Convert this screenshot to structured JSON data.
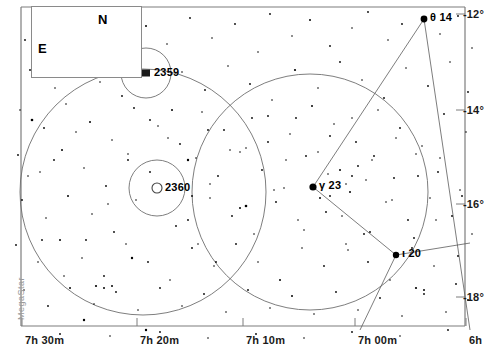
{
  "chart_data": {
    "type": "scatter",
    "xlabel": "Right Ascension",
    "ylabel": "Declination",
    "grid": false,
    "legend": "none",
    "xlim": [
      "7h 35m",
      "6h 55m"
    ],
    "ylim": [
      -19.0,
      -11.5
    ],
    "x_ticks": [
      {
        "label": "7h 30m",
        "px": 22
      },
      {
        "label": "7h 20m",
        "px": 137
      },
      {
        "label": "7h 10m",
        "px": 243
      },
      {
        "label": "7h 00m",
        "px": 355
      },
      {
        "label": "6h",
        "px": 466
      }
    ],
    "y_ticks": [
      {
        "label": "-12°",
        "px": 14
      },
      {
        "label": "-14°",
        "px": 110
      },
      {
        "label": "-16°",
        "px": 204
      },
      {
        "label": "-18°",
        "px": 297
      }
    ],
    "named_stars": [
      {
        "name": "θ 14",
        "x": 424,
        "y": 19,
        "mag_px": 3.4
      },
      {
        "name": "γ 23",
        "x": 313,
        "y": 187,
        "mag_px": 3.6
      },
      {
        "name": "ι 20",
        "x": 396,
        "y": 255,
        "mag_px": 3.2
      }
    ],
    "deep_sky_objects": [
      {
        "name": "2359",
        "type": "nebula",
        "x": 146,
        "y": 73,
        "circle_r": 25
      },
      {
        "name": "2360",
        "type": "open-cluster",
        "x": 157,
        "y": 188,
        "circle_r": 28
      }
    ],
    "fov_circles": [
      {
        "cx": 143,
        "cy": 192,
        "r": 123
      },
      {
        "cx": 310,
        "cy": 192,
        "r": 118
      }
    ],
    "constellation_lines": [
      {
        "x1": 424,
        "y1": 19,
        "x2": 313,
        "y2": 187
      },
      {
        "x1": 313,
        "y1": 187,
        "x2": 396,
        "y2": 255
      },
      {
        "x1": 396,
        "y1": 255,
        "x2": 470,
        "y2": 243
      },
      {
        "x1": 396,
        "y1": 255,
        "x2": 360,
        "y2": 330
      },
      {
        "x1": 424,
        "y1": 19,
        "x2": 470,
        "y2": 330
      }
    ],
    "stars": [
      [
        25,
        40,
        0.9
      ],
      [
        48,
        22,
        0.8
      ],
      [
        70,
        55,
        0.9
      ],
      [
        95,
        33,
        0.8
      ],
      [
        118,
        48,
        0.9
      ],
      [
        146,
        26,
        1.0
      ],
      [
        167,
        44,
        0.8
      ],
      [
        190,
        18,
        0.9
      ],
      [
        212,
        38,
        0.8
      ],
      [
        235,
        24,
        0.9
      ],
      [
        258,
        52,
        0.8
      ],
      [
        270,
        14,
        0.9
      ],
      [
        292,
        36,
        0.8
      ],
      [
        310,
        20,
        1.0
      ],
      [
        330,
        46,
        0.9
      ],
      [
        352,
        28,
        0.8
      ],
      [
        368,
        12,
        0.9
      ],
      [
        388,
        40,
        0.8
      ],
      [
        402,
        24,
        0.9
      ],
      [
        440,
        34,
        0.8
      ],
      [
        458,
        16,
        0.9
      ],
      [
        472,
        48,
        0.8
      ],
      [
        30,
        70,
        0.9
      ],
      [
        55,
        88,
        0.8
      ],
      [
        78,
        64,
        1.0
      ],
      [
        100,
        82,
        0.8
      ],
      [
        122,
        96,
        0.9
      ],
      [
        182,
        72,
        0.8
      ],
      [
        205,
        90,
        0.9
      ],
      [
        228,
        66,
        0.8
      ],
      [
        250,
        84,
        0.9
      ],
      [
        272,
        100,
        0.8
      ],
      [
        295,
        70,
        1.1
      ],
      [
        318,
        88,
        0.8
      ],
      [
        340,
        62,
        0.9
      ],
      [
        362,
        80,
        0.8
      ],
      [
        384,
        98,
        0.9
      ],
      [
        406,
        68,
        0.8
      ],
      [
        428,
        86,
        0.9
      ],
      [
        450,
        62,
        0.8
      ],
      [
        468,
        92,
        0.9
      ],
      [
        20,
        110,
        0.8
      ],
      [
        44,
        128,
        0.9
      ],
      [
        66,
        104,
        0.8
      ],
      [
        90,
        122,
        1.0
      ],
      [
        112,
        140,
        0.8
      ],
      [
        134,
        108,
        0.9
      ],
      [
        158,
        126,
        0.8
      ],
      [
        180,
        144,
        0.9
      ],
      [
        202,
        112,
        0.8
      ],
      [
        224,
        130,
        0.9
      ],
      [
        246,
        148,
        0.8
      ],
      [
        268,
        116,
        0.9
      ],
      [
        290,
        134,
        0.8
      ],
      [
        312,
        106,
        1.0
      ],
      [
        334,
        124,
        0.8
      ],
      [
        356,
        142,
        0.9
      ],
      [
        378,
        110,
        0.8
      ],
      [
        400,
        128,
        0.9
      ],
      [
        422,
        146,
        0.8
      ],
      [
        444,
        114,
        0.9
      ],
      [
        466,
        132,
        0.8
      ],
      [
        18,
        155,
        0.9
      ],
      [
        40,
        172,
        0.8
      ],
      [
        62,
        150,
        1.0
      ],
      [
        84,
        168,
        0.8
      ],
      [
        106,
        186,
        0.9
      ],
      [
        128,
        154,
        0.8
      ],
      [
        150,
        172,
        0.9
      ],
      [
        196,
        158,
        0.8
      ],
      [
        218,
        176,
        0.9
      ],
      [
        240,
        152,
        0.8
      ],
      [
        262,
        170,
        0.9
      ],
      [
        284,
        188,
        0.8
      ],
      [
        306,
        156,
        0.9
      ],
      [
        328,
        174,
        0.8
      ],
      [
        350,
        192,
        1.0
      ],
      [
        372,
        160,
        0.8
      ],
      [
        394,
        178,
        0.9
      ],
      [
        416,
        154,
        0.8
      ],
      [
        438,
        172,
        0.9
      ],
      [
        460,
        190,
        0.8
      ],
      [
        22,
        200,
        0.9
      ],
      [
        46,
        218,
        0.8
      ],
      [
        68,
        196,
        1.0
      ],
      [
        92,
        214,
        0.8
      ],
      [
        114,
        232,
        0.9
      ],
      [
        136,
        200,
        0.8
      ],
      [
        188,
        220,
        0.9
      ],
      [
        210,
        198,
        0.8
      ],
      [
        232,
        216,
        0.9
      ],
      [
        254,
        234,
        0.8
      ],
      [
        276,
        202,
        0.9
      ],
      [
        298,
        220,
        0.8
      ],
      [
        320,
        198,
        1.0
      ],
      [
        342,
        216,
        0.8
      ],
      [
        364,
        234,
        0.9
      ],
      [
        386,
        202,
        0.8
      ],
      [
        408,
        220,
        0.9
      ],
      [
        430,
        198,
        0.8
      ],
      [
        452,
        216,
        0.9
      ],
      [
        472,
        234,
        0.8
      ],
      [
        16,
        245,
        0.9
      ],
      [
        38,
        262,
        0.8
      ],
      [
        60,
        240,
        1.0
      ],
      [
        82,
        258,
        0.8
      ],
      [
        104,
        276,
        0.9
      ],
      [
        126,
        244,
        0.8
      ],
      [
        148,
        262,
        0.9
      ],
      [
        170,
        280,
        0.8
      ],
      [
        192,
        248,
        0.9
      ],
      [
        214,
        266,
        0.8
      ],
      [
        236,
        244,
        0.9
      ],
      [
        258,
        262,
        0.8
      ],
      [
        280,
        280,
        1.0
      ],
      [
        302,
        248,
        0.8
      ],
      [
        324,
        266,
        0.9
      ],
      [
        346,
        244,
        0.8
      ],
      [
        368,
        262,
        0.9
      ],
      [
        390,
        280,
        0.8
      ],
      [
        412,
        248,
        0.9
      ],
      [
        434,
        266,
        0.8
      ],
      [
        456,
        284,
        0.9
      ],
      [
        24,
        290,
        0.8
      ],
      [
        48,
        306,
        0.9
      ],
      [
        70,
        288,
        1.0
      ],
      [
        94,
        304,
        0.8
      ],
      [
        116,
        292,
        0.9
      ],
      [
        138,
        310,
        0.8
      ],
      [
        160,
        288,
        0.9
      ],
      [
        182,
        306,
        0.8
      ],
      [
        204,
        294,
        0.9
      ],
      [
        226,
        312,
        0.8
      ],
      [
        248,
        290,
        0.9
      ],
      [
        270,
        308,
        0.8
      ],
      [
        292,
        296,
        1.0
      ],
      [
        314,
        314,
        0.8
      ],
      [
        336,
        292,
        0.9
      ],
      [
        358,
        310,
        0.8
      ],
      [
        380,
        298,
        0.9
      ],
      [
        402,
        316,
        0.8
      ],
      [
        424,
        294,
        0.9
      ],
      [
        446,
        312,
        0.8
      ],
      [
        468,
        300,
        0.9
      ],
      [
        32,
        120,
        1.3
      ],
      [
        84,
        320,
        1.2
      ],
      [
        246,
        206,
        1.3
      ],
      [
        240,
        208,
        1.0
      ],
      [
        188,
        160,
        1.2
      ],
      [
        132,
        258,
        1.2
      ],
      [
        96,
        286,
        1.1
      ],
      [
        104,
        288,
        1.0
      ],
      [
        112,
        286,
        1.0
      ],
      [
        416,
        288,
        1.1
      ],
      [
        424,
        290,
        1.0
      ],
      [
        146,
        330,
        1.2
      ],
      [
        60,
        334,
        0.9
      ],
      [
        110,
        336,
        0.8
      ],
      [
        160,
        332,
        0.9
      ],
      [
        208,
        338,
        0.8
      ],
      [
        256,
        334,
        0.9
      ],
      [
        304,
        338,
        0.8
      ],
      [
        352,
        332,
        0.9
      ],
      [
        400,
        336,
        0.8
      ],
      [
        448,
        330,
        0.9
      ],
      [
        172,
        110,
        1.0
      ],
      [
        150,
        120,
        0.9
      ],
      [
        168,
        138,
        0.8
      ],
      [
        192,
        196,
        0.9
      ],
      [
        210,
        184,
        0.8
      ],
      [
        176,
        226,
        0.9
      ],
      [
        198,
        244,
        0.8
      ],
      [
        216,
        262,
        0.9
      ],
      [
        128,
        160,
        0.9
      ],
      [
        108,
        204,
        0.8
      ],
      [
        86,
        240,
        0.9
      ],
      [
        64,
        276,
        0.8
      ],
      [
        42,
        240,
        0.9
      ],
      [
        28,
        176,
        0.8
      ],
      [
        54,
        160,
        0.9
      ],
      [
        76,
        132,
        0.8
      ],
      [
        330,
        136,
        0.9
      ],
      [
        352,
        118,
        0.8
      ],
      [
        374,
        156,
        0.9
      ],
      [
        396,
        138,
        0.8
      ],
      [
        418,
        176,
        0.9
      ],
      [
        440,
        158,
        0.8
      ],
      [
        462,
        196,
        0.9
      ],
      [
        286,
        160,
        0.8
      ],
      [
        268,
        142,
        0.9
      ],
      [
        304,
        230,
        0.8
      ],
      [
        326,
        212,
        0.9
      ],
      [
        348,
        250,
        0.8
      ],
      [
        370,
        232,
        0.9
      ],
      [
        392,
        200,
        0.8
      ],
      [
        414,
        238,
        0.9
      ],
      [
        436,
        220,
        0.8
      ],
      [
        458,
        256,
        0.9
      ],
      [
        340,
        170,
        1.0
      ],
      [
        352,
        176,
        0.9
      ],
      [
        346,
        184,
        0.8
      ],
      [
        358,
        166,
        0.9
      ],
      [
        366,
        180,
        0.8
      ],
      [
        330,
        196,
        0.9
      ],
      [
        318,
        152,
        0.8
      ],
      [
        296,
        118,
        0.9
      ],
      [
        274,
        190,
        0.8
      ],
      [
        252,
        118,
        0.9
      ],
      [
        230,
        150,
        0.8
      ],
      [
        208,
        130,
        0.9
      ]
    ]
  },
  "compass": {
    "north_label": "N",
    "east_label": "E"
  },
  "watermark": {
    "text": "MegaStar"
  }
}
